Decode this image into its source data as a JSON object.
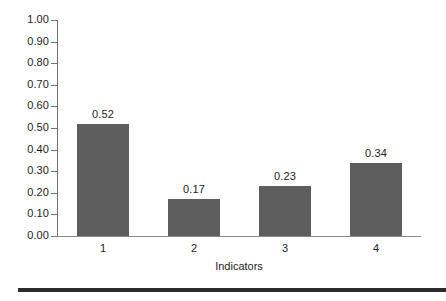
{
  "chart_data": {
    "type": "bar",
    "title": "",
    "subtitle": "",
    "xlabel": "Indicators",
    "ylabel": "",
    "categories": [
      "1",
      "2",
      "3",
      "4"
    ],
    "values": [
      0.52,
      0.17,
      0.23,
      0.34
    ],
    "value_labels": [
      "0.52",
      "0.17",
      "0.23",
      "0.34"
    ],
    "ylim": [
      0.0,
      1.0
    ],
    "ytick_step": 0.1,
    "ytick_labels": [
      "1.00",
      "0.90",
      "0.80",
      "0.70",
      "0.60",
      "0.50",
      "0.40",
      "0.30",
      "0.20",
      "0.10",
      "0.00"
    ],
    "ytick_values": [
      1.0,
      0.9,
      0.8,
      0.7,
      0.6,
      0.5,
      0.4,
      0.3,
      0.2,
      0.1,
      0.0
    ],
    "grid": false,
    "legend": false,
    "legend_position": "none",
    "bar_color": "#5e5e5e",
    "axis_color": "#737373",
    "text_color": "#1d1d1d"
  },
  "figure": {
    "bottom_rule_color": "#2b2b2b"
  }
}
